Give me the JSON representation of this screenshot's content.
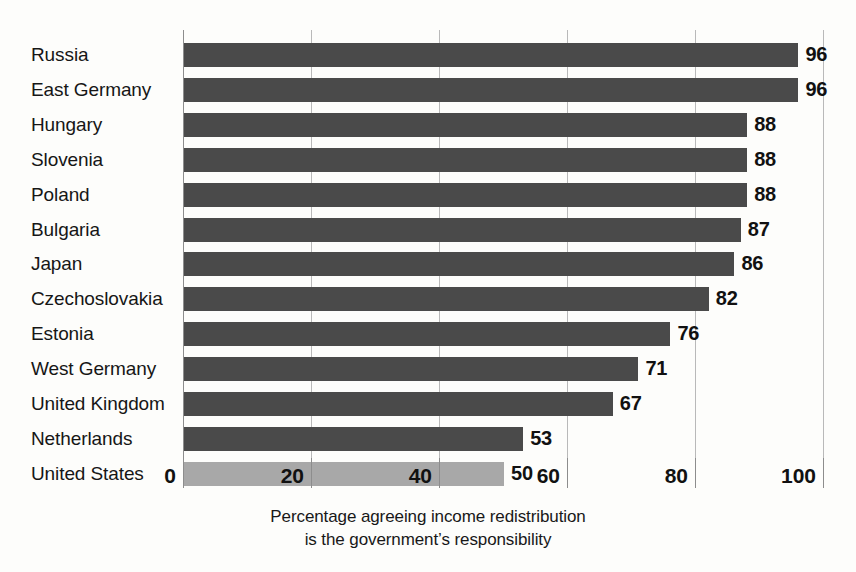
{
  "chart_data": {
    "type": "bar",
    "orientation": "horizontal",
    "title": "",
    "subtitle": "",
    "xlabel": "Percentage agreeing income redistribution is the government's responsibility",
    "ylabel": "",
    "xlim": [
      0,
      100
    ],
    "xticks": [
      "0",
      "20",
      "40",
      "60",
      "80",
      "100"
    ],
    "xtick_values": [
      0,
      20,
      40,
      60,
      80,
      100
    ],
    "grid": true,
    "legend": "none",
    "categories": [
      "Russia",
      "East Germany",
      "Hungary",
      "Slovenia",
      "Poland",
      "Bulgaria",
      "Japan",
      "Czechoslovakia",
      "Estonia",
      "West Germany",
      "United Kingdom",
      "Netherlands",
      "United States"
    ],
    "values": [
      96,
      96,
      88,
      88,
      88,
      87,
      86,
      82,
      76,
      71,
      67,
      53,
      50
    ],
    "value_labels": [
      "96",
      "96",
      "88",
      "88",
      "88",
      "87",
      "86",
      "82",
      "76",
      "71",
      "67",
      "53",
      "50"
    ],
    "highlight_category": "United States",
    "bar_colors": {
      "default": "#4a4a4a",
      "highlight": "#a8a8a8"
    },
    "axis_color": "#8d8d8d",
    "grid_color": "#b9b9b9",
    "background": "#fdfdfb"
  },
  "caption": {
    "line1": "Percentage agreeing income redistribution",
    "line2": "is the government’s responsibility"
  }
}
